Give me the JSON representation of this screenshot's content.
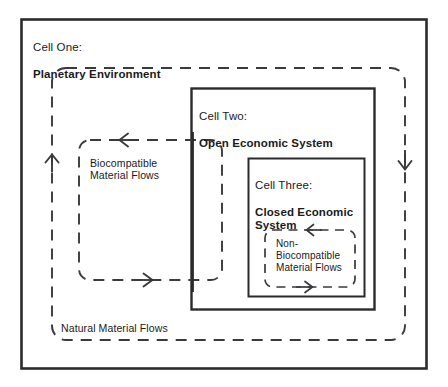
{
  "diagram": {
    "title_implied": "Three-cell model of material flows",
    "colors": {
      "stroke": "#2b2b2b",
      "background": "#ffffff",
      "text": "#1a1a1a"
    },
    "cells": [
      {
        "id": "cell-one",
        "prefix": "Cell One:",
        "name": "Planetary Environment",
        "border_style": "solid",
        "x": 21,
        "y": 19,
        "w": 406,
        "h": 350
      },
      {
        "id": "cell-two",
        "prefix": "Cell Two:",
        "name": "Open Economic System",
        "border_style": "solid",
        "x": 191,
        "y": 88,
        "w": 184,
        "h": 222
      },
      {
        "id": "cell-three",
        "prefix": "Cell Three:",
        "name": "Closed Economic System",
        "border_style": "solid",
        "x": 248,
        "y": 158,
        "w": 117,
        "h": 139
      }
    ],
    "flow_loops": [
      {
        "id": "natural-material-flows",
        "label": "Natural Material Flows",
        "border_style": "dashed",
        "x": 52,
        "y": 68,
        "w": 353,
        "h": 272,
        "arrows": [
          {
            "name": "arrow-up-left",
            "direction": "up",
            "x": 52,
            "y": 163
          },
          {
            "name": "arrow-down-right",
            "direction": "down",
            "x": 405,
            "y": 161
          }
        ]
      },
      {
        "id": "biocompatible-material-flows",
        "label": "Biocompatible\nMaterial Flows",
        "border_style": "dashed",
        "x": 79,
        "y": 140,
        "w": 143,
        "h": 140,
        "arrows": [
          {
            "name": "arrow-left-top",
            "direction": "left",
            "x": 128,
            "y": 140
          },
          {
            "name": "arrow-right-bottom",
            "direction": "right",
            "x": 150,
            "y": 280
          }
        ]
      },
      {
        "id": "non-biocompatible-material-flows",
        "label": "Non-\nBiocompatible\nMaterial Flows",
        "border_style": "dashed",
        "x": 265,
        "y": 230,
        "w": 90,
        "h": 57,
        "arrows": [
          {
            "name": "arrow-left-top",
            "direction": "left",
            "x": 314,
            "y": 230
          },
          {
            "name": "arrow-right-bottom",
            "direction": "right",
            "x": 310,
            "y": 287
          }
        ]
      }
    ],
    "labels": {
      "cell_one_prefix": "Cell One:",
      "cell_one_name": "Planetary Environment",
      "cell_two_prefix": "Cell Two:",
      "cell_two_name": "Open Economic System",
      "cell_three_prefix": "Cell Three:",
      "cell_three_name": "Closed Economic System",
      "biocompatible_flows": "Biocompatible\nMaterial Flows",
      "non_biocompatible_flows": "Non-\nBiocompatible\nMaterial Flows",
      "natural_flows": "Natural Material Flows"
    }
  }
}
